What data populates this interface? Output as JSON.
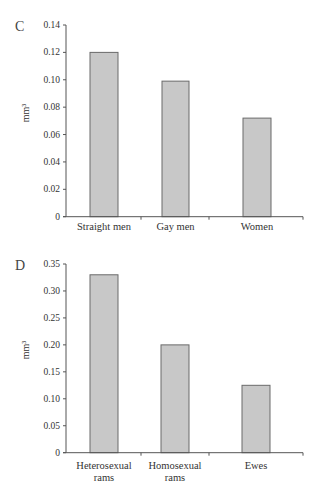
{
  "header": {
    "text": ""
  },
  "chart_data": [
    {
      "panel": "C",
      "type": "bar",
      "title": "",
      "xlabel": "",
      "ylabel": "mm³",
      "ylim": [
        0,
        0.14
      ],
      "yticks": [
        "0",
        "0.02",
        "0.04",
        "0.06",
        "0.08",
        "0.10",
        "0.12",
        "0.14"
      ],
      "ytick_values": [
        0,
        0.02,
        0.04,
        0.06,
        0.08,
        0.1,
        0.12,
        0.14
      ],
      "categories": [
        [
          "Straight men"
        ],
        [
          "Gay men"
        ],
        [
          "Women"
        ]
      ],
      "values": [
        0.12,
        0.099,
        0.072
      ],
      "grid": false,
      "legend": null,
      "bar_fill": "#c8c8c8",
      "bar_stroke": "#6a6a6a"
    },
    {
      "panel": "D",
      "type": "bar",
      "title": "",
      "xlabel": "",
      "ylabel": "mm³",
      "ylim": [
        0,
        0.35
      ],
      "yticks": [
        "0",
        "0.05",
        "0.10",
        "0.15",
        "0.20",
        "0.25",
        "0.30",
        "0.35"
      ],
      "ytick_values": [
        0,
        0.05,
        0.1,
        0.15,
        0.2,
        0.25,
        0.3,
        0.35
      ],
      "categories": [
        [
          "Heterosexual",
          "rams"
        ],
        [
          "Homosexual",
          "rams"
        ],
        [
          "Ewes"
        ]
      ],
      "values": [
        0.33,
        0.2,
        0.125
      ],
      "grid": false,
      "legend": null,
      "bar_fill": "#c8c8c8",
      "bar_stroke": "#6a6a6a"
    }
  ]
}
